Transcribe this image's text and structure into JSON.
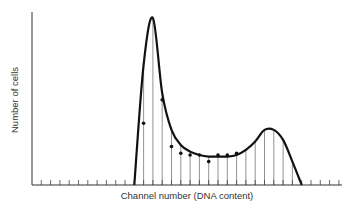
{
  "chart_data": {
    "type": "line",
    "title": "",
    "xlabel": "Channel number (DNA content)",
    "ylabel": "Number of cells",
    "grid": false,
    "legend": null,
    "ticks_unlabeled": true,
    "x": [
      11,
      12,
      13,
      14,
      15,
      16,
      17,
      18,
      19,
      20,
      21,
      22,
      23,
      24,
      25,
      26,
      27,
      28,
      29
    ],
    "curve_values": [
      0,
      72,
      100,
      55,
      33,
      24,
      20,
      18,
      17,
      17,
      17,
      18,
      21,
      26,
      33,
      33,
      27,
      14,
      0
    ],
    "series": [
      {
        "name": "measured",
        "points": [
          {
            "x": 12,
            "y": 37
          },
          {
            "x": 14,
            "y": 51
          },
          {
            "x": 15,
            "y": 23
          },
          {
            "x": 16,
            "y": 19
          },
          {
            "x": 17,
            "y": 18
          },
          {
            "x": 18,
            "y": 18
          },
          {
            "x": 19,
            "y": 14
          },
          {
            "x": 20,
            "y": 18
          },
          {
            "x": 21,
            "y": 18
          },
          {
            "x": 22,
            "y": 19
          }
        ]
      }
    ],
    "xlim": [
      0,
      33
    ],
    "ylim": [
      0,
      105
    ]
  },
  "axes": {
    "ylabel": "Number of cells",
    "xlabel": "Channel number (DNA content)"
  }
}
